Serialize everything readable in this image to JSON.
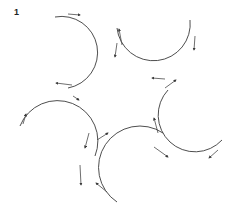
{
  "figure": {
    "label": "1",
    "stroke_color": "#3a3a3a",
    "arcs": [
      {
        "id": "arc-top-left",
        "cx": 88,
        "cy": 48,
        "r": 34
      },
      {
        "id": "arc-top-right",
        "cx": 150,
        "cy": 55,
        "r": 34
      },
      {
        "id": "arc-right",
        "cx": 188,
        "cy": 123,
        "r": 36
      },
      {
        "id": "arc-bottom",
        "cx": 118,
        "cy": 162,
        "r": 36
      },
      {
        "id": "arc-left",
        "cx": 56,
        "cy": 125,
        "r": 36
      }
    ]
  }
}
